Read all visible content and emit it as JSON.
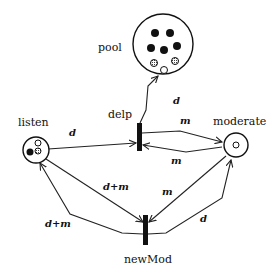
{
  "diagram": {
    "type": "petri-net",
    "places": [
      {
        "id": "pool",
        "label": "pool",
        "tokens": {
          "black": 6,
          "hatched": 2,
          "white": 1
        }
      },
      {
        "id": "listen",
        "label": "listen",
        "tokens": {
          "black": 1,
          "white": 1,
          "hatched": 1
        }
      },
      {
        "id": "moderate",
        "label": "moderate",
        "tokens": {
          "white": 1
        }
      }
    ],
    "transitions": [
      {
        "id": "delp",
        "label": "delp"
      },
      {
        "id": "newMod",
        "label": "newMod"
      }
    ],
    "arcs": [
      {
        "from": "listen",
        "to": "delp",
        "label": "d"
      },
      {
        "from": "delp",
        "to": "pool",
        "label": "d"
      },
      {
        "from": "delp",
        "to": "moderate",
        "label": "m"
      },
      {
        "from": "moderate",
        "to": "delp",
        "label": "m"
      },
      {
        "from": "listen",
        "to": "newMod",
        "label": "d+m"
      },
      {
        "from": "newMod",
        "to": "listen",
        "label": "d+m"
      },
      {
        "from": "moderate",
        "to": "newMod",
        "label": "m"
      },
      {
        "from": "newMod",
        "to": "moderate",
        "label": "d"
      }
    ]
  },
  "labels": {
    "pool": "pool",
    "listen": "listen",
    "moderate": "moderate",
    "delp": "delp",
    "newMod": "newMod",
    "arc_listen_delp": "d",
    "arc_delp_pool": "d",
    "arc_delp_moderate": "m",
    "arc_moderate_delp": "m",
    "arc_listen_newMod": "d+m",
    "arc_newMod_listen": "d+m",
    "arc_moderate_newMod": "m",
    "arc_newMod_moderate": "d"
  }
}
